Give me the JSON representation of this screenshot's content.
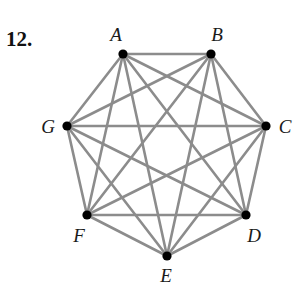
{
  "problem": {
    "number": "12."
  },
  "graph": {
    "type": "complete graph K7",
    "edge_color": "#8c8c8c",
    "vertex_color": "#000000",
    "vertices": [
      {
        "id": "A",
        "label": "A",
        "x": 123,
        "y": 54,
        "lx": 116,
        "ly": 41
      },
      {
        "id": "B",
        "label": "B",
        "x": 211,
        "y": 54,
        "lx": 217,
        "ly": 41
      },
      {
        "id": "C",
        "label": "C",
        "x": 266,
        "y": 126,
        "lx": 285,
        "ly": 133
      },
      {
        "id": "D",
        "label": "D",
        "x": 246,
        "y": 215,
        "lx": 254,
        "ly": 242
      },
      {
        "id": "E",
        "label": "E",
        "x": 167,
        "y": 256,
        "lx": 166,
        "ly": 282
      },
      {
        "id": "F",
        "label": "F",
        "x": 87,
        "y": 215,
        "lx": 79,
        "ly": 242
      },
      {
        "id": "G",
        "label": "G",
        "x": 67,
        "y": 126,
        "lx": 48,
        "ly": 133
      }
    ],
    "edges": [
      [
        "A",
        "B"
      ],
      [
        "A",
        "C"
      ],
      [
        "A",
        "D"
      ],
      [
        "A",
        "E"
      ],
      [
        "A",
        "F"
      ],
      [
        "A",
        "G"
      ],
      [
        "B",
        "C"
      ],
      [
        "B",
        "D"
      ],
      [
        "B",
        "E"
      ],
      [
        "B",
        "F"
      ],
      [
        "B",
        "G"
      ],
      [
        "C",
        "D"
      ],
      [
        "C",
        "E"
      ],
      [
        "C",
        "F"
      ],
      [
        "C",
        "G"
      ],
      [
        "D",
        "E"
      ],
      [
        "D",
        "F"
      ],
      [
        "D",
        "G"
      ],
      [
        "E",
        "F"
      ],
      [
        "E",
        "G"
      ],
      [
        "F",
        "G"
      ]
    ]
  }
}
